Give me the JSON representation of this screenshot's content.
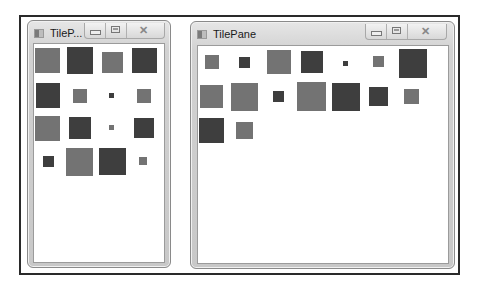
{
  "windows": [
    {
      "title": "TileP...",
      "full_title": "TilePane",
      "icons": {
        "app": "app-window-icon",
        "minimize": "minimize-icon",
        "maximize": "maximize-icon",
        "close": "close-icon"
      },
      "tiles": [
        {
          "shade": "medium",
          "size": "large"
        },
        {
          "shade": "dark",
          "size": "large"
        },
        {
          "shade": "medium",
          "size": "medium"
        },
        {
          "shade": "dark",
          "size": "large"
        },
        {
          "shade": "dark",
          "size": "large"
        },
        {
          "shade": "medium",
          "size": "small"
        },
        {
          "shade": "dark",
          "size": "tiny"
        },
        {
          "shade": "medium",
          "size": "small"
        },
        {
          "shade": "medium",
          "size": "large"
        },
        {
          "shade": "dark",
          "size": "medium"
        },
        {
          "shade": "medium",
          "size": "tiny"
        },
        {
          "shade": "dark",
          "size": "medium"
        },
        {
          "shade": "dark",
          "size": "small"
        },
        {
          "shade": "medium",
          "size": "large"
        },
        {
          "shade": "dark",
          "size": "large"
        },
        {
          "shade": "medium",
          "size": "tiny"
        }
      ]
    },
    {
      "title": "TilePane",
      "full_title": "TilePane",
      "icons": {
        "app": "app-window-icon",
        "minimize": "minimize-icon",
        "maximize": "maximize-icon",
        "close": "close-icon"
      },
      "tiles": [
        {
          "shade": "medium",
          "size": "small"
        },
        {
          "shade": "dark",
          "size": "small"
        },
        {
          "shade": "medium",
          "size": "large"
        },
        {
          "shade": "dark",
          "size": "medium"
        },
        {
          "shade": "dark",
          "size": "tiny"
        },
        {
          "shade": "medium",
          "size": "small"
        },
        {
          "shade": "dark",
          "size": "large"
        },
        {
          "shade": "medium",
          "size": "medium"
        },
        {
          "shade": "medium",
          "size": "large"
        },
        {
          "shade": "dark",
          "size": "small"
        },
        {
          "shade": "medium",
          "size": "large"
        },
        {
          "shade": "dark",
          "size": "large"
        },
        {
          "shade": "dark",
          "size": "medium"
        },
        {
          "shade": "medium",
          "size": "small"
        },
        {
          "shade": "dark",
          "size": "large"
        },
        {
          "shade": "medium",
          "size": "medium"
        }
      ]
    }
  ],
  "colors": {
    "dark_tile": "#3e3e3e",
    "medium_tile": "#737373",
    "content_bg": "#ffffff"
  }
}
